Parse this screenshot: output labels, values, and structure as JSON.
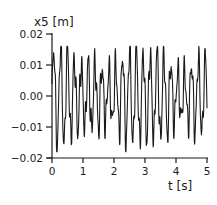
{
  "chart_data": {
    "type": "line",
    "title": "",
    "ylabel": "x5 [m]",
    "xlabel": "t [s]",
    "xlim": [
      0,
      5
    ],
    "ylim": [
      -0.02,
      0.02
    ],
    "x_ticks": [
      "0",
      "1",
      "2",
      "3",
      "4",
      "5"
    ],
    "y_ticks": [
      "0.02",
      "0.01",
      "0.00",
      "-0.01",
      "-0.02"
    ],
    "grid": false,
    "legend": null,
    "series": [
      {
        "name": "x5",
        "description": "Irregular oscillation around 0 with about 4.5 cycles per second; dominant peaks around +0.013 to +0.016 and troughs around -0.014 to -0.018, with a smaller superimposed high-frequency component.",
        "amplitude_approx": 0.015,
        "dominant_frequency_hz_approx": 4.5,
        "x": [
          0.0,
          0.1,
          0.2,
          0.3,
          0.4,
          0.5,
          0.6,
          0.7,
          0.8,
          0.9,
          1.0,
          1.1,
          1.2,
          1.3,
          1.4,
          1.5,
          1.6,
          1.7,
          1.8,
          1.9,
          2.0,
          2.1,
          2.2,
          2.3,
          2.4,
          2.5,
          2.6,
          2.7,
          2.8,
          2.9,
          3.0,
          3.1,
          3.2,
          3.3,
          3.4,
          3.5,
          3.6,
          3.7,
          3.8,
          3.9,
          4.0,
          4.1,
          4.2,
          4.3,
          4.4,
          4.5,
          4.6,
          4.7,
          4.8,
          4.9,
          5.0
        ],
        "y_envelope_max": 0.016,
        "y_envelope_min": -0.018
      }
    ]
  },
  "axes": {
    "ylabel": "x5 [m]",
    "xlabel": "t [s]",
    "y_ticks": [
      {
        "label": "0.02",
        "value": 0.02
      },
      {
        "label": "0.01",
        "value": 0.01
      },
      {
        "label": "0.00",
        "value": 0.0
      },
      {
        "label": "−0.01",
        "value": -0.01
      },
      {
        "label": "−0.02",
        "value": -0.02
      }
    ],
    "x_ticks": [
      {
        "label": "0",
        "value": 0
      },
      {
        "label": "1",
        "value": 1
      },
      {
        "label": "2",
        "value": 2
      },
      {
        "label": "3",
        "value": 3
      },
      {
        "label": "4",
        "value": 4
      },
      {
        "label": "5",
        "value": 5
      }
    ]
  },
  "style": {
    "line_color": "#1a1a1a",
    "axis_color": "#1a1a1a",
    "background": "#ffffff"
  }
}
